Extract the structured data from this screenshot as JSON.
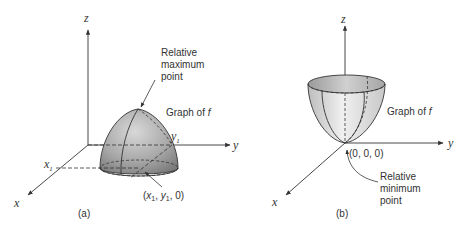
{
  "panels": [
    {
      "id": "a",
      "caption": "(a)",
      "axes": {
        "z": "z",
        "y": "y",
        "x": "x"
      },
      "ticks": {
        "x": "x",
        "x_sub": "1",
        "y": "y",
        "y_sub": "1"
      },
      "surface_label": "Graph of f",
      "surface_label_main": "Graph of ",
      "surface_label_var": "f",
      "annotation": [
        "Relative",
        "maximum",
        "point"
      ],
      "point_label": {
        "open": "(",
        "x": "x",
        "x_sub": "1",
        "sep1": ", ",
        "y": "y",
        "y_sub": "1",
        "rest": ", 0)"
      },
      "shape": "dome (relative maximum)"
    },
    {
      "id": "b",
      "caption": "(b)",
      "axes": {
        "z": "z",
        "y": "y",
        "x": "x"
      },
      "surface_label": "Graph of f",
      "surface_label_main": "Graph of ",
      "surface_label_var": "f",
      "annotation": [
        "Relative",
        "minimum",
        "point"
      ],
      "point_label": "(0, 0, 0)",
      "shape": "bowl (relative minimum)"
    }
  ],
  "colors": {
    "line": "#333333",
    "surface_dark": "#8a8a8a",
    "surface_light": "#e6e6e6"
  }
}
